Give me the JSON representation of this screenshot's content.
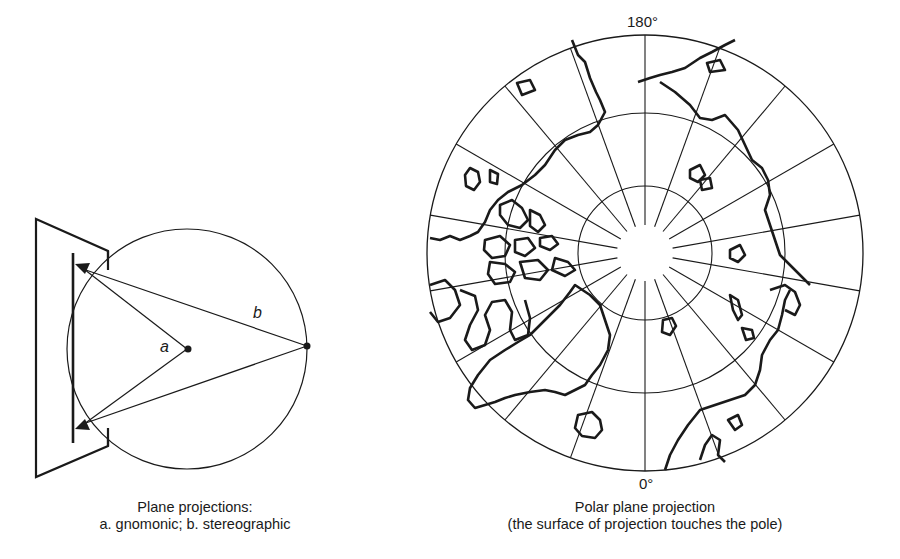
{
  "left_figure": {
    "label_a": "a",
    "label_b": "b",
    "caption_line1": "Plane projections:",
    "caption_line2": "a. gnomonic; b.  stereographic"
  },
  "right_figure": {
    "top_meridian_label": "180°",
    "bottom_meridian_label": "0°",
    "caption_line1": "Polar plane projection",
    "caption_line2": "(the surface of projection touches the pole)",
    "meridian_count": 18,
    "parallel_rings": 3
  },
  "colors": {
    "line": "#1a1a1a",
    "background": "#ffffff"
  }
}
